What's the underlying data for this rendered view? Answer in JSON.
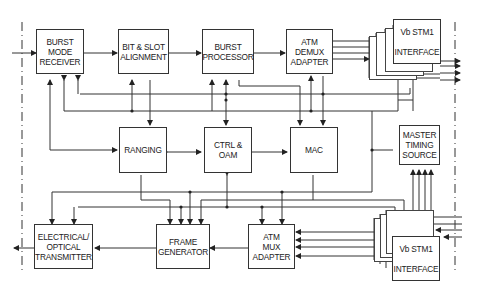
{
  "diagram": {
    "type": "block-diagram",
    "blocks": {
      "burst_mode_receiver": "BURST\nMODE\nRECEIVER",
      "bit_slot_alignment": "BIT & SLOT\nALIGNMENT",
      "burst_processor": "BURST\nPROCESSOR",
      "atm_demux_adapter": "ATM\nDEMUX\nADAPTER",
      "vb_stm1_interface_top": "Vb STM1\n\nINTERFACE",
      "ranging": "RANGING",
      "ctrl_oam": "CTRL &\nOAM",
      "mac": "MAC",
      "master_timing_source": "MASTER\nTIMING\nSOURCE",
      "electrical_optical_transmitter": "ELECTRICAL/\nOPTICAL\nTRANSMITTER",
      "frame_generator": "FRAME\nGENERATOR",
      "atm_mux_adapter": "ATM\nMUX\nADAPTER",
      "vb_stm1_interface_bottom": "Vb STM1\n\nINTERFACE"
    },
    "colors": {
      "line": "#333333",
      "background": "#ffffff"
    }
  }
}
